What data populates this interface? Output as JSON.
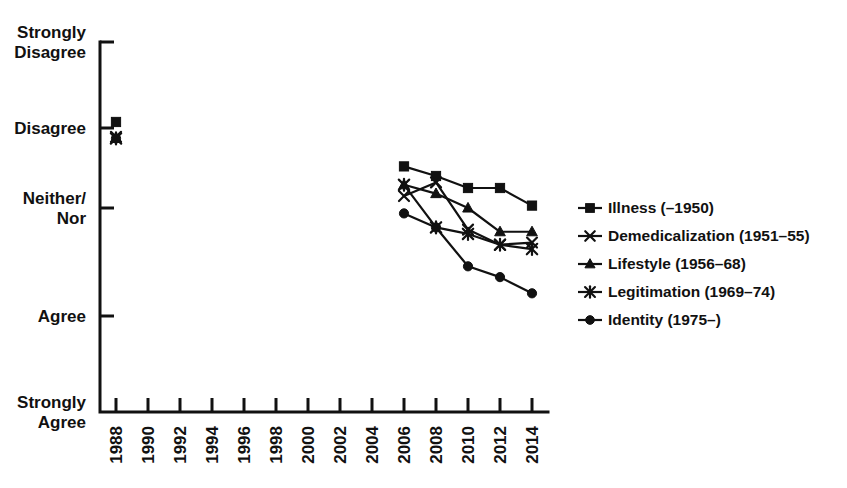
{
  "chart_data": {
    "type": "line",
    "title": "",
    "xlabel": "",
    "ylabel": "",
    "grid": false,
    "legend_position": "right",
    "x_tick_labels": [
      "1988",
      "1990",
      "1992",
      "1994",
      "1996",
      "1998",
      "2000",
      "2002",
      "2004",
      "2006",
      "2008",
      "2010",
      "2012",
      "2014"
    ],
    "x": [
      1988,
      1990,
      1992,
      1994,
      1996,
      1998,
      2000,
      2002,
      2004,
      2006,
      2008,
      2010,
      2012,
      2014
    ],
    "xlim": [
      1987,
      2015
    ],
    "y_tick_labels": [
      "Strongly\nDisagree",
      "Disagree",
      "Neither/\nNor",
      "Agree",
      "Strongly\nAgree"
    ],
    "y_categories": [
      "Strongly Disagree",
      "Disagree",
      "Neither/Nor",
      "Agree",
      "Strongly Agree"
    ],
    "y_values": [
      5,
      4,
      3,
      2,
      1
    ],
    "ylim": [
      1,
      5
    ],
    "series": [
      {
        "name": "Illness (–1950)",
        "marker": "square",
        "points": [
          {
            "x": 1988,
            "y": 4.07
          },
          {
            "x": 2006,
            "y": 3.52
          },
          {
            "x": 2008,
            "y": 3.4
          },
          {
            "x": 2010,
            "y": 3.25
          },
          {
            "x": 2012,
            "y": 3.25
          },
          {
            "x": 2014,
            "y": 3.03
          }
        ]
      },
      {
        "name": "Demedicalization (1951–55)",
        "marker": "x",
        "points": [
          {
            "x": 1988,
            "y": 3.89
          },
          {
            "x": 2006,
            "y": 3.15
          },
          {
            "x": 2008,
            "y": 3.32
          },
          {
            "x": 2010,
            "y": 2.8
          },
          {
            "x": 2012,
            "y": 2.66
          },
          {
            "x": 2014,
            "y": 2.68
          }
        ]
      },
      {
        "name": "Lifestyle (1956–68)",
        "marker": "triangle",
        "points": [
          {
            "x": 1988,
            "y": 3.87
          },
          {
            "x": 2006,
            "y": 3.29
          },
          {
            "x": 2008,
            "y": 3.18
          },
          {
            "x": 2010,
            "y": 3.0
          },
          {
            "x": 2012,
            "y": 2.78
          },
          {
            "x": 2014,
            "y": 2.78
          }
        ]
      },
      {
        "name": "Legitimation (1969–74)",
        "marker": "star",
        "points": [
          {
            "x": 1988,
            "y": 3.87
          },
          {
            "x": 2006,
            "y": 3.29
          },
          {
            "x": 2008,
            "y": 2.82
          },
          {
            "x": 2010,
            "y": 2.76
          },
          {
            "x": 2012,
            "y": 2.66
          },
          {
            "x": 2014,
            "y": 2.62
          }
        ]
      },
      {
        "name": "Identity (1975–)",
        "marker": "circle",
        "points": [
          {
            "x": 1988,
            "y": 3.87
          },
          {
            "x": 2006,
            "y": 2.95
          },
          {
            "x": 2008,
            "y": 2.82
          },
          {
            "x": 2010,
            "y": 2.46
          },
          {
            "x": 2012,
            "y": 2.36
          },
          {
            "x": 2014,
            "y": 2.21
          }
        ]
      }
    ]
  },
  "legend": {
    "items": [
      {
        "label": "Illness (–1950)",
        "marker": "square"
      },
      {
        "label": "Demedicalization (1951–55)",
        "marker": "x"
      },
      {
        "label": "Lifestyle (1956–68)",
        "marker": "triangle"
      },
      {
        "label": "Legitimation (1969–74)",
        "marker": "star"
      },
      {
        "label": "Identity (1975–)",
        "marker": "circle"
      }
    ]
  },
  "colors": {
    "ink": "#111111",
    "background": "#ffffff"
  }
}
